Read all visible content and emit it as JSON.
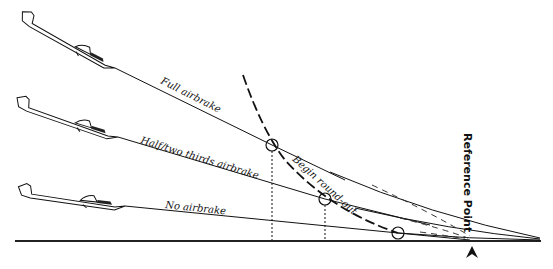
{
  "diagram": {
    "labels": {
      "full_airbrake": "Full airbrake",
      "half_airbrake": "Half/two thirds airbrake",
      "no_airbrake": "No airbrake",
      "begin_roundout": "Begin round-out",
      "reference_point": "Reference Point"
    },
    "approach_paths": [
      {
        "name": "full-airbrake",
        "from": [
          115,
          68
        ],
        "to": [
          490,
          238
        ]
      },
      {
        "name": "half-airbrake",
        "from": [
          118,
          137
        ],
        "to": [
          500,
          238
        ]
      },
      {
        "name": "no-airbrake",
        "from": [
          125,
          206
        ],
        "to": [
          510,
          238
        ]
      }
    ],
    "roundout_points": [
      {
        "x": 272,
        "y": 145
      },
      {
        "x": 325,
        "y": 199
      },
      {
        "x": 398,
        "y": 233
      }
    ],
    "ground_y": 240,
    "reference_arrow_x": 472,
    "colors": {
      "ink": "#111111",
      "background": "#ffffff"
    }
  }
}
